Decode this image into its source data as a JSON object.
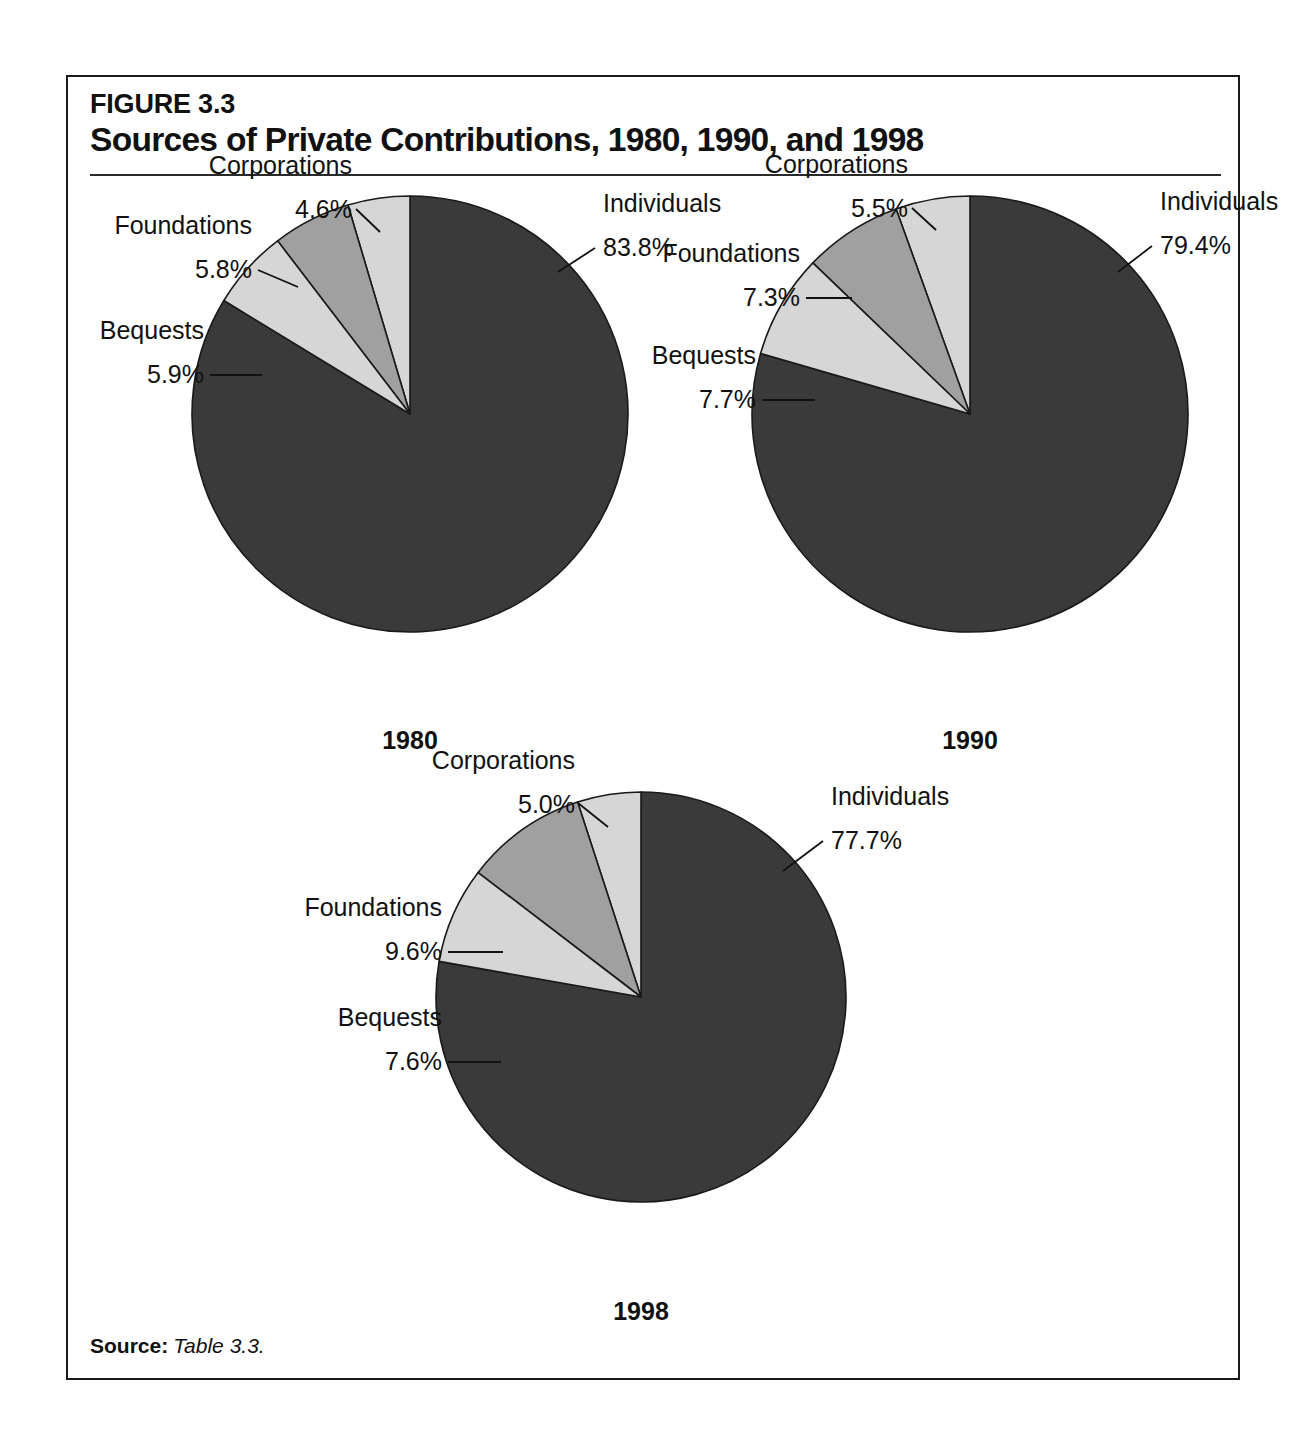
{
  "figure": {
    "number": "FIGURE 3.3",
    "title": "Sources of Private Contributions, 1980, 1990, and 1998",
    "source_label": "Source:",
    "source_reference": "Table 3.3."
  },
  "colors": {
    "individuals": "#3a3a3a",
    "corporations": "#d6d6d6",
    "foundations": "#a0a0a0",
    "bequests": "#d6d6d6",
    "outline": "#1a1a1a",
    "text": "#111111",
    "background": "#ffffff"
  },
  "chart_data": [
    {
      "type": "pie",
      "title": "1980",
      "categories": [
        "Individuals",
        "Corporations",
        "Foundations",
        "Bequests"
      ],
      "values": [
        83.8,
        4.6,
        5.8,
        5.9
      ],
      "labels": [
        "83.8%",
        "4.6%",
        "5.8%",
        "5.9%"
      ],
      "unit": "percent",
      "legend": "labels-outside",
      "grid": false
    },
    {
      "type": "pie",
      "title": "1990",
      "categories": [
        "Individuals",
        "Corporations",
        "Foundations",
        "Bequests"
      ],
      "values": [
        79.4,
        5.5,
        7.3,
        7.7
      ],
      "labels": [
        "79.4%",
        "5.5%",
        "7.3%",
        "7.7%"
      ],
      "unit": "percent",
      "legend": "labels-outside",
      "grid": false
    },
    {
      "type": "pie",
      "title": "1998",
      "categories": [
        "Individuals",
        "Corporations",
        "Foundations",
        "Bequests"
      ],
      "values": [
        77.7,
        5.0,
        9.6,
        7.6
      ],
      "labels": [
        "77.7%",
        "5.0%",
        "9.6%",
        "7.6%"
      ],
      "unit": "percent",
      "legend": "labels-outside",
      "grid": false
    }
  ],
  "pies": {
    "p1980": {
      "year": "1980",
      "individuals_name": "Individuals",
      "individuals_value": "83.8%",
      "corporations_name": "Corporations",
      "corporations_value": "4.6%",
      "foundations_name": "Foundations",
      "foundations_value": "5.8%",
      "bequests_name": "Bequests",
      "bequests_value": "5.9%"
    },
    "p1990": {
      "year": "1990",
      "individuals_name": "Individuals",
      "individuals_value": "79.4%",
      "corporations_name": "Corporations",
      "corporations_value": "5.5%",
      "foundations_name": "Foundations",
      "foundations_value": "7.3%",
      "bequests_name": "Bequests",
      "bequests_value": "7.7%"
    },
    "p1998": {
      "year": "1998",
      "individuals_name": "Individuals",
      "individuals_value": "77.7%",
      "corporations_name": "Corporations",
      "corporations_value": "5.0%",
      "foundations_name": "Foundations",
      "foundations_value": "9.6%",
      "bequests_name": "Bequests",
      "bequests_value": "7.6%"
    }
  }
}
